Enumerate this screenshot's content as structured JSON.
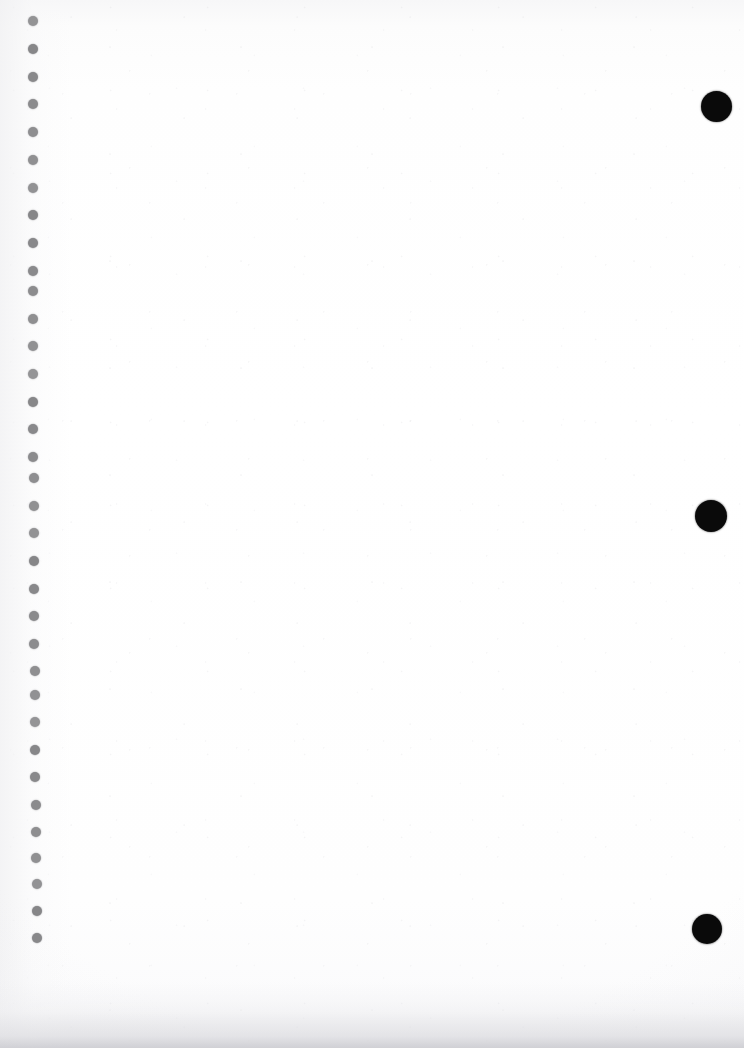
{
  "page": {
    "width": 744,
    "height": 1048,
    "background_color": "#fefefe",
    "paper_tint_color": "#f7f7f8",
    "edge_shadow_color": "#cdcdd2",
    "content_text": ""
  },
  "binding": {
    "name": "spiral-binding-punch-holes",
    "hole_count": 34,
    "hole_color": "#868688",
    "hole_diameter": 10,
    "center_x": 33,
    "first_center_y": 21,
    "spacing_y": 27.8,
    "holes": [
      {
        "cx": 33,
        "cy": 21,
        "d": 10
      },
      {
        "cx": 33,
        "cy": 49,
        "d": 10
      },
      {
        "cx": 33,
        "cy": 77,
        "d": 10
      },
      {
        "cx": 33,
        "cy": 104,
        "d": 10
      },
      {
        "cx": 33,
        "cy": 132,
        "d": 10
      },
      {
        "cx": 33,
        "cy": 160,
        "d": 10
      },
      {
        "cx": 33,
        "cy": 188,
        "d": 10
      },
      {
        "cx": 33,
        "cy": 215,
        "d": 10
      },
      {
        "cx": 33,
        "cy": 243,
        "d": 10
      },
      {
        "cx": 33,
        "cy": 271,
        "d": 10
      },
      {
        "cx": 33,
        "cy": 291,
        "d": 10
      },
      {
        "cx": 33,
        "cy": 319,
        "d": 10
      },
      {
        "cx": 33,
        "cy": 346,
        "d": 10
      },
      {
        "cx": 33,
        "cy": 374,
        "d": 10
      },
      {
        "cx": 33,
        "cy": 402,
        "d": 10
      },
      {
        "cx": 33,
        "cy": 429,
        "d": 10
      },
      {
        "cx": 33,
        "cy": 457,
        "d": 10
      },
      {
        "cx": 34,
        "cy": 478,
        "d": 10
      },
      {
        "cx": 34,
        "cy": 506,
        "d": 10
      },
      {
        "cx": 34,
        "cy": 533,
        "d": 10
      },
      {
        "cx": 34,
        "cy": 561,
        "d": 10
      },
      {
        "cx": 34,
        "cy": 589,
        "d": 10
      },
      {
        "cx": 34,
        "cy": 616,
        "d": 10
      },
      {
        "cx": 34,
        "cy": 644,
        "d": 10
      },
      {
        "cx": 35,
        "cy": 671,
        "d": 10
      },
      {
        "cx": 35,
        "cy": 695,
        "d": 10
      },
      {
        "cx": 35,
        "cy": 722,
        "d": 10
      },
      {
        "cx": 35,
        "cy": 750,
        "d": 10
      },
      {
        "cx": 35,
        "cy": 777,
        "d": 10
      },
      {
        "cx": 36,
        "cy": 805,
        "d": 10
      },
      {
        "cx": 36,
        "cy": 832,
        "d": 10
      },
      {
        "cx": 36,
        "cy": 858,
        "d": 10
      },
      {
        "cx": 37,
        "cy": 884,
        "d": 10
      },
      {
        "cx": 37,
        "cy": 911,
        "d": 10
      },
      {
        "cx": 37,
        "cy": 938,
        "d": 10
      }
    ]
  },
  "ink_marks": {
    "name": "black-ink-dot-marks",
    "color": "#0a0a0a",
    "count": 3,
    "marks": [
      {
        "label": "ink-mark-top",
        "cx": 716,
        "cy": 106,
        "d": 31
      },
      {
        "label": "ink-mark-middle",
        "cx": 711,
        "cy": 516,
        "d": 32
      },
      {
        "label": "ink-mark-bottom",
        "cx": 707,
        "cy": 929,
        "d": 30
      }
    ]
  }
}
